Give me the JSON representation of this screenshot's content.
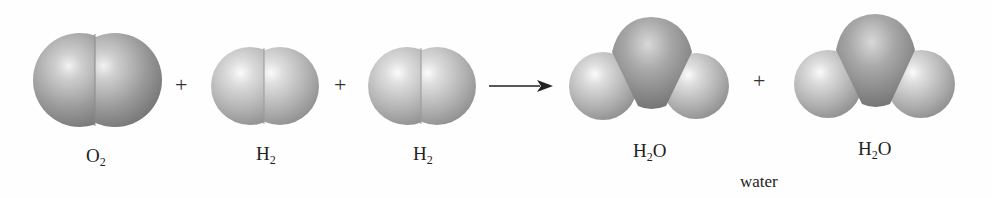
{
  "equation": {
    "reactants": [
      {
        "formula_main": "O",
        "formula_sub": "2",
        "name": "oxygen molecule"
      },
      {
        "formula_main": "H",
        "formula_sub": "2",
        "name": "hydrogen molecule"
      },
      {
        "formula_main": "H",
        "formula_sub": "2",
        "name": "hydrogen molecule"
      }
    ],
    "products": [
      {
        "formula_main": "H",
        "formula_sub": "2",
        "formula_tail": "O",
        "name": "water molecule"
      },
      {
        "formula_main": "H",
        "formula_sub": "2",
        "formula_tail": "O",
        "name": "water molecule"
      }
    ],
    "operators": {
      "plus": "+",
      "arrow": "yields-arrow"
    },
    "product_caption": "water"
  },
  "colors": {
    "oxygen_atom": "#8e8e8e",
    "hydrogen_atom": "#b8b8b8",
    "highlight": "#f4f4f4",
    "text": "#222222"
  }
}
